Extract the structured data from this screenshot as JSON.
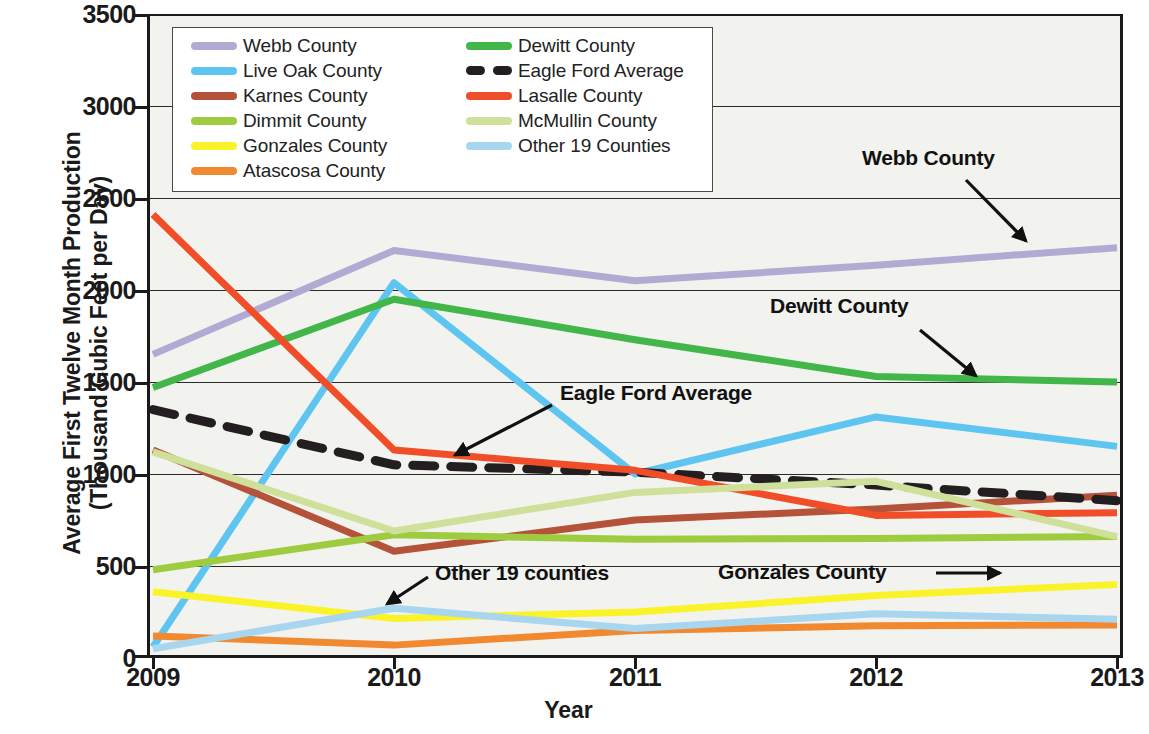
{
  "chart": {
    "type": "line",
    "y_axis_title_lines": [
      "Average First Twelve Month Production",
      "(Thousand Cubic Feet per Day)"
    ],
    "x_axis_title": "Year",
    "y_tick_labels": [
      "3500",
      "3000",
      "2500",
      "2000",
      "1500",
      "1000",
      "500",
      "0"
    ],
    "x_tick_labels": [
      "2009",
      "2010",
      "2011",
      "2012",
      "2013"
    ]
  },
  "legend": {
    "left_column": [
      {
        "label": "Webb County",
        "color": "#b3aad4",
        "style": "solid"
      },
      {
        "label": "Live Oak County",
        "color": "#5ec5f0",
        "style": "solid"
      },
      {
        "label": "Karnes County",
        "color": "#b5523a",
        "style": "solid"
      },
      {
        "label": "Dimmit County",
        "color": "#9ec councils"
      },
      {
        "label": "Gonzales County",
        "color": "#fbf32a",
        "style": "solid"
      },
      {
        "label": "Atascosa County",
        "color": "#f0892f",
        "style": "solid"
      }
    ],
    "right_column": [
      {
        "label": "Dewitt County",
        "color": "#43b649",
        "style": "solid"
      },
      {
        "label": "Eagle Ford Average",
        "color": "#231f20",
        "style": "dashed"
      },
      {
        "label": "Lasalle County",
        "color": "#f04e29",
        "style": "solid"
      },
      {
        "label": "McMullin County",
        "color": "#cfe09b",
        "style": "solid"
      },
      {
        "label": "Other 19 Counties",
        "color": "#a8d6ee",
        "style": "solid"
      }
    ]
  },
  "annotations": [
    {
      "id": "webb",
      "text": "Webb County"
    },
    {
      "id": "dewitt",
      "text": "Dewitt  County"
    },
    {
      "id": "eagleford",
      "text": "Eagle Ford Average"
    },
    {
      "id": "other19",
      "text": "Other 19 counties"
    },
    {
      "id": "gonzales",
      "text": "Gonzales County"
    }
  ],
  "chart_data": {
    "type": "line",
    "title": "",
    "xlabel": "Year",
    "ylabel": "Average First Twelve Month Production (Thousand Cubic Feet per Day)",
    "categories": [
      "2009",
      "2010",
      "2011",
      "2012",
      "2013"
    ],
    "x": [
      2009,
      2010,
      2011,
      2012,
      2013
    ],
    "ylim": [
      0,
      3500
    ],
    "ytick_step": 500,
    "grid": true,
    "legend_position": "top-left-inside",
    "series": [
      {
        "name": "Webb County",
        "color": "#b3aad4",
        "style": "solid",
        "values": [
          1650,
          2215,
          2050,
          2135,
          2230
        ]
      },
      {
        "name": "Live Oak County",
        "color": "#5ec5f0",
        "style": "solid",
        "values": [
          60,
          2040,
          1000,
          1310,
          1150
        ]
      },
      {
        "name": "Karnes County",
        "color": "#b5523a",
        "style": "solid",
        "values": [
          1130,
          580,
          750,
          810,
          885
        ]
      },
      {
        "name": "Dimmit County",
        "color": "#9ecb3f",
        "style": "solid",
        "values": [
          480,
          670,
          645,
          650,
          660
        ]
      },
      {
        "name": "Gonzales County",
        "color": "#fbf32a",
        "style": "solid",
        "values": [
          360,
          215,
          250,
          340,
          400
        ]
      },
      {
        "name": "Atascosa County",
        "color": "#f0892f",
        "style": "solid",
        "values": [
          120,
          70,
          150,
          175,
          180
        ]
      },
      {
        "name": "Dewitt County",
        "color": "#43b649",
        "style": "solid",
        "values": [
          1470,
          1950,
          1730,
          1530,
          1500
        ]
      },
      {
        "name": "Eagle Ford Average",
        "color": "#231f20",
        "style": "dashed",
        "values": [
          1350,
          1050,
          1010,
          940,
          855
        ]
      },
      {
        "name": "Lasalle County",
        "color": "#f04e29",
        "style": "solid",
        "values": [
          2410,
          1130,
          1020,
          775,
          790
        ]
      },
      {
        "name": "McMullin County",
        "color": "#cfe09b",
        "style": "solid",
        "values": [
          1120,
          690,
          900,
          960,
          660
        ]
      },
      {
        "name": "Other 19 Counties",
        "color": "#a8d6ee",
        "style": "solid",
        "values": [
          50,
          270,
          160,
          240,
          210
        ]
      }
    ]
  }
}
